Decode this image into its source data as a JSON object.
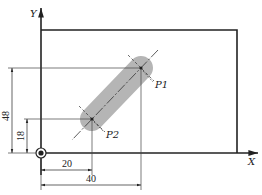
{
  "diagram": {
    "type": "cnc-slot-drawing",
    "axes": {
      "x_label": "X",
      "y_label": "Y"
    },
    "points": [
      {
        "name": "P1",
        "x": 40,
        "y": 48
      },
      {
        "name": "P2",
        "x": 20,
        "y": 18
      }
    ],
    "dimensions": {
      "horizontal": [
        "20",
        "40"
      ],
      "vertical": [
        "48",
        "18"
      ]
    },
    "colors": {
      "line": "#222222",
      "slot": "#b5b5b5",
      "thin": "#555555"
    }
  }
}
